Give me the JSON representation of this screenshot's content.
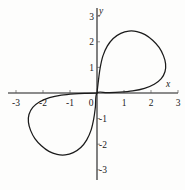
{
  "figure": {
    "background_color": "#fdfdfc",
    "curve_color": "#1b1b1b",
    "axis_color": "#1a1a1a",
    "x_axis_name": "x",
    "y_axis_name": "y"
  },
  "chart_data": {
    "type": "line",
    "title": "",
    "subtitle": "",
    "xlabel": "x",
    "ylabel": "y",
    "xlim": [
      -3,
      3
    ],
    "ylim": [
      -3,
      3
    ],
    "grid": false,
    "legend": null,
    "x_ticks": [
      -3,
      -2,
      -1,
      0,
      1,
      2,
      3
    ],
    "x_tick_labels": [
      "-3",
      "-2",
      "-1",
      "0",
      "1",
      "2",
      "3"
    ],
    "y_ticks": [
      -3,
      -2,
      -1,
      0,
      1,
      2,
      3
    ],
    "y_tick_labels": [
      "-3",
      "-2",
      "-1",
      "0",
      "1",
      "2",
      "3"
    ],
    "series": [
      {
        "name": "curve",
        "closed": true,
        "points": [
          [
            0.0,
            0.0
          ],
          [
            0.06,
            0.55
          ],
          [
            0.12,
            1.0
          ],
          [
            0.22,
            1.45
          ],
          [
            0.38,
            1.83
          ],
          [
            0.6,
            2.13
          ],
          [
            0.88,
            2.33
          ],
          [
            1.18,
            2.42
          ],
          [
            1.48,
            2.4
          ],
          [
            1.78,
            2.28
          ],
          [
            2.06,
            2.06
          ],
          [
            2.3,
            1.78
          ],
          [
            2.46,
            1.46
          ],
          [
            2.54,
            1.14
          ],
          [
            2.52,
            0.84
          ],
          [
            2.38,
            0.56
          ],
          [
            2.12,
            0.34
          ],
          [
            1.76,
            0.18
          ],
          [
            1.32,
            0.08
          ],
          [
            0.84,
            0.03
          ],
          [
            0.38,
            0.01
          ],
          [
            0.0,
            0.0
          ],
          [
            -0.06,
            -0.55
          ],
          [
            -0.12,
            -1.0
          ],
          [
            -0.22,
            -1.45
          ],
          [
            -0.38,
            -1.83
          ],
          [
            -0.6,
            -2.13
          ],
          [
            -0.88,
            -2.33
          ],
          [
            -1.18,
            -2.42
          ],
          [
            -1.48,
            -2.4
          ],
          [
            -1.78,
            -2.28
          ],
          [
            -2.06,
            -2.06
          ],
          [
            -2.3,
            -1.78
          ],
          [
            -2.46,
            -1.46
          ],
          [
            -2.54,
            -1.14
          ],
          [
            -2.52,
            -0.84
          ],
          [
            -2.38,
            -0.56
          ],
          [
            -2.12,
            -0.34
          ],
          [
            -1.76,
            -0.18
          ],
          [
            -1.32,
            -0.08
          ],
          [
            -0.84,
            -0.03
          ],
          [
            -0.38,
            -0.01
          ],
          [
            0.0,
            0.0
          ]
        ]
      }
    ]
  }
}
